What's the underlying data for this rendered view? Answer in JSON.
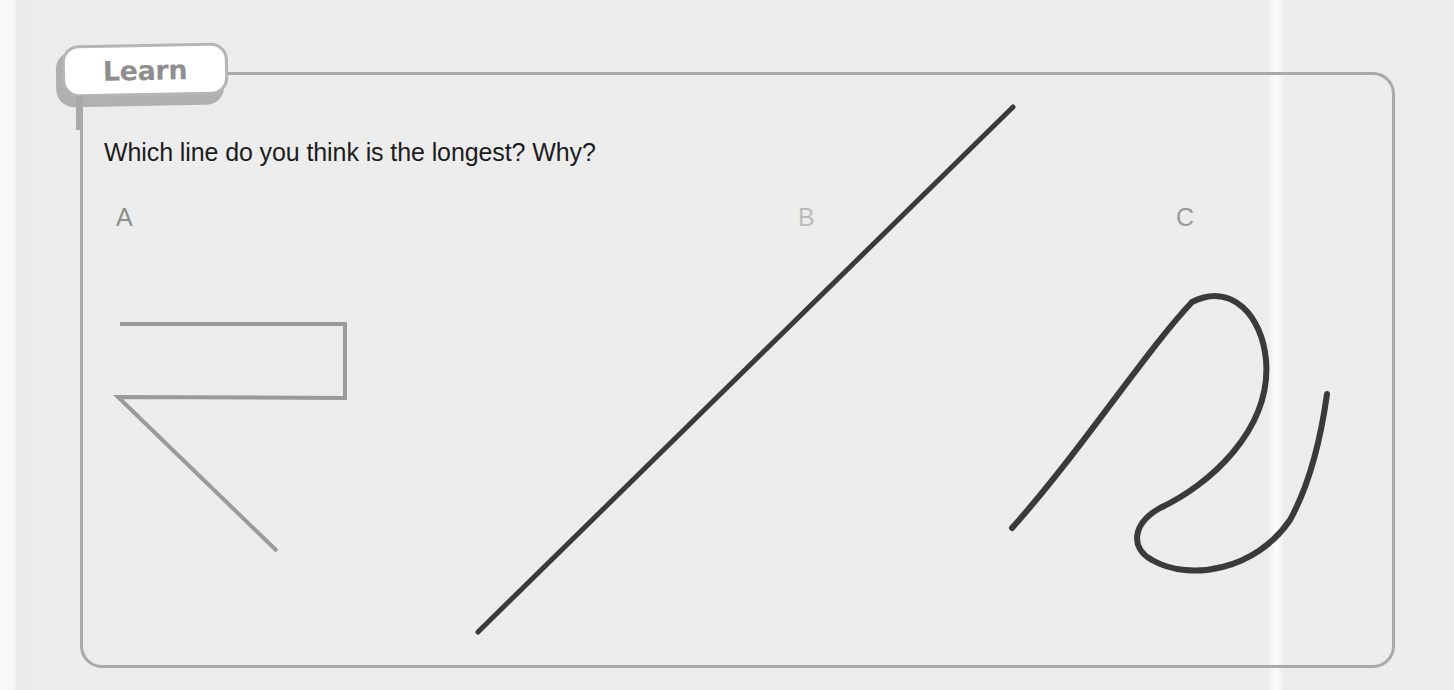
{
  "page": {
    "background_color": "#ededed",
    "paper_fold_visible": true
  },
  "panel": {
    "tab_label": "Learn",
    "tab_text_color": "#8e8e8e",
    "border_color": "#a9a9a9"
  },
  "question": {
    "text": "Which line do you think is the longest? Why?",
    "color": "#1c1c1c"
  },
  "items": [
    {
      "label": "A",
      "label_color": "#8f8f8f",
      "stroke_color": "#9a9a9a",
      "stroke_width": 4,
      "shape": "zigzag-polyline",
      "description": "A straight polyline: runs right along the top, turns down, runs back left, then slants down to the right.",
      "points": "120,324 345,324 345,398 118,397 277,551"
    },
    {
      "label": "B",
      "label_color": "#bcbcbc",
      "stroke_color": "#3a3a3a",
      "stroke_width": 5,
      "shape": "straight-diagonal-line",
      "description": "A single straight diagonal line sloping up to the right.",
      "points": "478,632 1013,107"
    },
    {
      "label": "C",
      "label_color": "#9a9a9a",
      "stroke_color": "#3a3a3a",
      "stroke_width": 6,
      "shape": "curly-loop-curve",
      "description": "A long curved squiggle shaped like a cursive letter R with a loop at the top and a hook sweeping to the lower right.",
      "path": "M 1012 528 C 1080 452 1145 352 1192 302 C 1232 282 1262 316 1266 360 C 1272 430 1208 486 1160 508 C 1132 524 1130 548 1152 560 C 1190 582 1256 570 1290 520 C 1312 480 1322 430 1327 394"
    }
  ]
}
